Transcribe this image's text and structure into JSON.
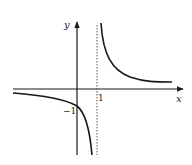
{
  "figure": {
    "type": "function-graph",
    "axes": {
      "x_label": "x",
      "y_label": "y"
    },
    "tick_labels": {
      "x_tick": "1",
      "y_tick": "−1"
    },
    "vertical_asymptote": {
      "x": 1,
      "style": "dashed"
    },
    "features": {
      "y_intercept": -1,
      "left_branch": "decreasing from near 0 to -infinity as x approaches 1 from the left",
      "right_branch": "decreasing from +infinity toward horizontal asymptote as x increases"
    },
    "colors": {
      "stroke": "#1a1a1a",
      "background": "#ffffff"
    }
  }
}
